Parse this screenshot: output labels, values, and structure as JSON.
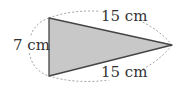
{
  "diagram": {
    "shape": "isosceles-triangle",
    "fill_color": "#c8c8c8",
    "stroke_color": "#444444",
    "dash_color": "#999999",
    "vertices": {
      "top_left": [
        49,
        18
      ],
      "bottom_left": [
        49,
        76
      ],
      "right": [
        172,
        45
      ]
    },
    "labels": {
      "top_side": "15 cm",
      "left_side": "7 cm",
      "bottom_side": "15 cm"
    }
  }
}
